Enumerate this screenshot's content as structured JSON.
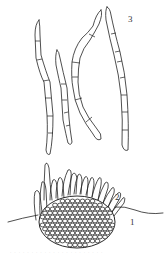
{
  "figure": {
    "labels": [
      {
        "id": "1",
        "text": "1",
        "x": 130,
        "y": 225
      },
      {
        "id": "2",
        "text": "2",
        "x": 115,
        "y": 200
      },
      {
        "id": "3",
        "text": "3",
        "x": 128,
        "y": 22
      }
    ],
    "caption": "· · · · · · · · · · · · · · · · · · · · · ·"
  }
}
